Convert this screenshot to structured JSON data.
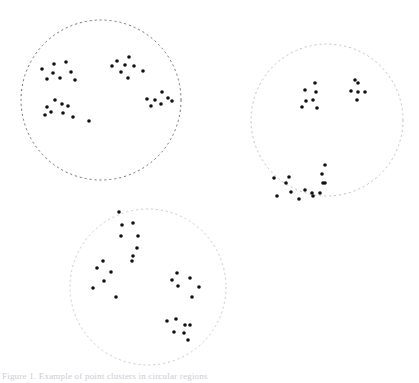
{
  "figure": {
    "background_color": "#ffffff",
    "width": 419,
    "height": 383,
    "caption_partial": "Figure 1. Example of point clusters in circular regions"
  },
  "chart_data": {
    "type": "scatter",
    "title": "",
    "subtitle": "",
    "xlabel": "",
    "ylabel": "",
    "xlim": [
      0,
      419
    ],
    "ylim": [
      0,
      383
    ],
    "grid": false,
    "legend": null,
    "axes_visible": false,
    "marker": {
      "shape": "circle",
      "radius": 1.8,
      "color": "#111111"
    },
    "regions": [
      {
        "name": "region-top-left",
        "shape": "circle",
        "cx": 101,
        "cy": 100,
        "r": 80,
        "stroke": "#5a5a66",
        "stroke_dasharray": "2 3",
        "stroke_width": 0.9,
        "fill": "none",
        "point_count": 32
      },
      {
        "name": "region-top-right",
        "shape": "circle",
        "cx": 327,
        "cy": 120,
        "r": 76,
        "stroke": "#b8b8c2",
        "stroke_dasharray": "2 3",
        "stroke_width": 0.9,
        "fill": "none",
        "point_count": 27
      },
      {
        "name": "region-bottom",
        "shape": "circle",
        "cx": 148,
        "cy": 287,
        "r": 78,
        "stroke": "#c2c2cc",
        "stroke_dasharray": "2 3",
        "stroke_width": 0.9,
        "fill": "none",
        "point_count": 28
      }
    ],
    "clusters": [
      {
        "region": "region-top-left",
        "name": "cluster-1a",
        "points": [
          [
            42,
            69
          ],
          [
            54,
            64
          ],
          [
            66,
            62
          ],
          [
            53,
            73
          ],
          [
            71,
            72
          ],
          [
            47,
            79
          ],
          [
            60,
            78
          ],
          [
            75,
            80
          ]
        ]
      },
      {
        "region": "region-top-left",
        "name": "cluster-1b",
        "points": [
          [
            117,
            61
          ],
          [
            129,
            57
          ],
          [
            112,
            66
          ],
          [
            125,
            65
          ],
          [
            134,
            66
          ],
          [
            121,
            72
          ],
          [
            128,
            78
          ],
          [
            143,
            71
          ]
        ]
      },
      {
        "region": "region-top-left",
        "name": "cluster-1c",
        "points": [
          [
            55,
            100
          ],
          [
            47,
            107
          ],
          [
            62,
            104
          ],
          [
            51,
            112
          ],
          [
            45,
            115
          ],
          [
            68,
            106
          ],
          [
            63,
            113
          ],
          [
            73,
            117
          ],
          [
            89,
            121
          ]
        ]
      },
      {
        "region": "region-top-left",
        "name": "cluster-1d",
        "points": [
          [
            162,
            92
          ],
          [
            147,
            99
          ],
          [
            155,
            100
          ],
          [
            168,
            98
          ],
          [
            151,
            106
          ],
          [
            161,
            104
          ],
          [
            172,
            101
          ]
        ]
      },
      {
        "region": "region-top-right",
        "name": "cluster-2a",
        "points": [
          [
            315,
            83
          ],
          [
            305,
            90
          ],
          [
            316,
            92
          ],
          [
            306,
            101
          ],
          [
            313,
            100
          ],
          [
            302,
            107
          ],
          [
            317,
            108
          ]
        ]
      },
      {
        "region": "region-top-right",
        "name": "cluster-2b",
        "points": [
          [
            355,
            80
          ],
          [
            358,
            83
          ],
          [
            351,
            91
          ],
          [
            358,
            92
          ],
          [
            365,
            92
          ],
          [
            357,
            100
          ]
        ]
      },
      {
        "region": "region-top-right",
        "name": "cluster-2c",
        "points": [
          [
            274,
            178
          ],
          [
            289,
            177
          ],
          [
            286,
            183
          ],
          [
            291,
            192
          ],
          [
            305,
            190
          ],
          [
            277,
            196
          ],
          [
            299,
            199
          ],
          [
            313,
            196
          ],
          [
            320,
            193
          ],
          [
            325,
            183
          ]
        ]
      },
      {
        "region": "region-top-right",
        "name": "cluster-2d",
        "points": [
          [
            325,
            165
          ],
          [
            322,
            174
          ],
          [
            323,
            183
          ],
          [
            312,
            193
          ]
        ]
      },
      {
        "region": "region-bottom",
        "name": "cluster-3a",
        "points": [
          [
            119,
            212
          ],
          [
            122,
            225
          ],
          [
            133,
            223
          ],
          [
            121,
            236
          ],
          [
            138,
            236
          ],
          [
            137,
            248
          ],
          [
            133,
            256
          ],
          [
            132,
            261
          ]
        ]
      },
      {
        "region": "region-bottom",
        "name": "cluster-3b",
        "points": [
          [
            103,
            261
          ],
          [
            97,
            268
          ],
          [
            111,
            272
          ],
          [
            104,
            281
          ],
          [
            93,
            288
          ],
          [
            116,
            297
          ]
        ]
      },
      {
        "region": "region-bottom",
        "name": "cluster-3c",
        "points": [
          [
            177,
            273
          ],
          [
            172,
            280
          ],
          [
            190,
            278
          ],
          [
            178,
            286
          ],
          [
            199,
            287
          ],
          [
            192,
            297
          ]
        ]
      },
      {
        "region": "region-bottom",
        "name": "cluster-3d",
        "points": [
          [
            167,
            321
          ],
          [
            176,
            319
          ],
          [
            185,
            325
          ],
          [
            190,
            325
          ],
          [
            174,
            332
          ],
          [
            184,
            333
          ],
          [
            188,
            340
          ]
        ]
      }
    ]
  }
}
